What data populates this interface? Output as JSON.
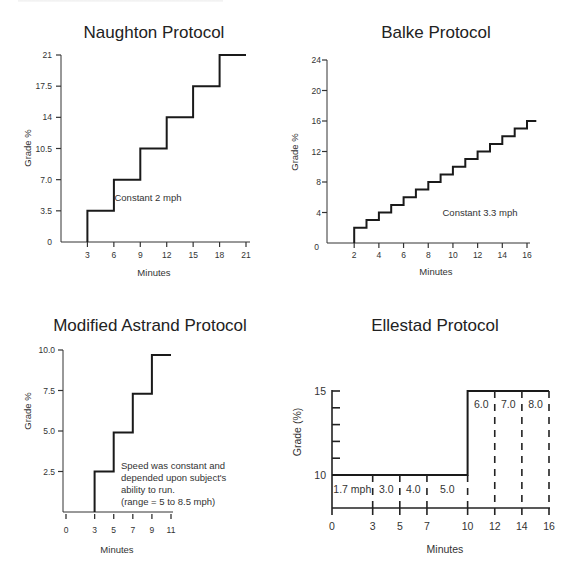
{
  "figure": {
    "header_fragment": ""
  },
  "chart_data": [
    {
      "id": "naughton",
      "type": "line",
      "title": "Naughton Protocol",
      "xlabel": "Minutes",
      "ylabel": "Grade %",
      "xticks": [
        3,
        6,
        9,
        12,
        15,
        18,
        21
      ],
      "yticks": [
        "0",
        "3.5",
        "7.0",
        "10.5",
        "14",
        "17.5",
        "21"
      ],
      "ytick_values": [
        0,
        3.5,
        7,
        10.5,
        14,
        17.5,
        21
      ],
      "xlim": [
        0,
        22
      ],
      "ylim": [
        0,
        21
      ],
      "step": "post",
      "x": [
        3,
        3,
        6,
        6,
        9,
        9,
        12,
        12,
        15,
        15,
        18,
        18,
        21
      ],
      "y": [
        0,
        3.5,
        3.5,
        7,
        7,
        10.5,
        10.5,
        14,
        14,
        17.5,
        17.5,
        21,
        21
      ],
      "annotations": [
        "Constant 2 mph"
      ],
      "grid": false
    },
    {
      "id": "balke",
      "type": "line",
      "title": "Balke Protocol",
      "xlabel": "Minutes",
      "ylabel": "Grade %",
      "xticks": [
        2,
        4,
        6,
        8,
        10,
        12,
        14,
        16
      ],
      "yticks": [
        "0",
        "4",
        "8",
        "12",
        "16",
        "20",
        "24"
      ],
      "ytick_values": [
        0,
        4,
        8,
        12,
        16,
        20,
        24
      ],
      "xlim": [
        0,
        17
      ],
      "ylim": [
        0,
        24
      ],
      "step": "post",
      "stages": [
        {
          "start": 2,
          "grade": 2
        },
        {
          "start": 3,
          "grade": 3
        },
        {
          "start": 4,
          "grade": 4
        },
        {
          "start": 5,
          "grade": 5
        },
        {
          "start": 6,
          "grade": 6
        },
        {
          "start": 7,
          "grade": 7
        },
        {
          "start": 8,
          "grade": 8
        },
        {
          "start": 9,
          "grade": 9
        },
        {
          "start": 10,
          "grade": 10
        },
        {
          "start": 11,
          "grade": 11
        },
        {
          "start": 12,
          "grade": 12
        },
        {
          "start": 13,
          "grade": 13
        },
        {
          "start": 14,
          "grade": 14
        },
        {
          "start": 15,
          "grade": 15
        },
        {
          "start": 16,
          "grade": 16
        }
      ],
      "end": 16.75,
      "annotations": [
        "Constant 3.3 mph"
      ],
      "grid": false
    },
    {
      "id": "astrand",
      "type": "line",
      "title": "Modified Astrand Protocol",
      "xlabel": "Minutes",
      "ylabel": "Grade %",
      "xticks": [
        0,
        3,
        5,
        7,
        9,
        11
      ],
      "yticks": [
        "2.5",
        "5.0",
        "7.5",
        "10.0"
      ],
      "ytick_values": [
        2.5,
        5,
        7.5,
        10
      ],
      "xlim": [
        0,
        11
      ],
      "ylim": [
        0,
        10
      ],
      "step": "post",
      "x": [
        3,
        3,
        5,
        5,
        7,
        7,
        9,
        9,
        11
      ],
      "y": [
        0,
        2.5,
        2.5,
        4.9,
        4.9,
        7.3,
        7.3,
        9.7,
        9.7
      ],
      "annotations": [
        "Speed was constant and",
        "depended upon subject's",
        "ability to run.",
        "(range = 5 to 8.5 mph)"
      ],
      "grid": false
    },
    {
      "id": "ellestad",
      "type": "line",
      "title": "Ellestad Protocol",
      "xlabel": "Minutes",
      "ylabel": "Grade (%)",
      "xticks": [
        0,
        3,
        5,
        7,
        10,
        12,
        14,
        16
      ],
      "yticks": [
        "10",
        "15"
      ],
      "ytick_values": [
        10,
        15
      ],
      "xlim": [
        0,
        16
      ],
      "ylim": [
        8,
        15
      ],
      "step": "post",
      "x": [
        0,
        10,
        10,
        16
      ],
      "y": [
        10,
        10,
        15,
        15
      ],
      "stage_boundaries": [
        3,
        5,
        7,
        10,
        12,
        14,
        16
      ],
      "speed_labels": [
        {
          "x": 1.5,
          "label": "1.7 mph",
          "level": "low"
        },
        {
          "x": 4,
          "label": "3.0",
          "level": "low"
        },
        {
          "x": 6,
          "label": "4.0",
          "level": "low"
        },
        {
          "x": 8.5,
          "label": "5.0",
          "level": "low"
        },
        {
          "x": 11,
          "label": "6.0",
          "level": "high"
        },
        {
          "x": 13,
          "label": "7.0",
          "level": "high"
        },
        {
          "x": 15,
          "label": "8.0",
          "level": "high"
        }
      ],
      "grid": false
    }
  ]
}
